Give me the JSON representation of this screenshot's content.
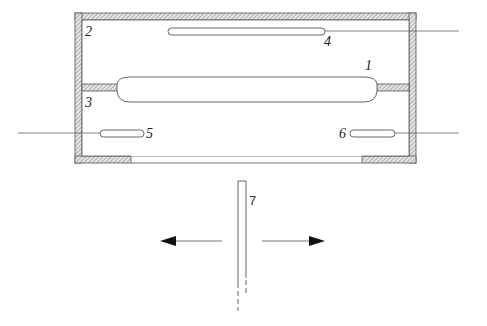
{
  "diagram": {
    "title": "",
    "colors": {
      "stroke": "#555555",
      "hatch": "#888888",
      "wire": "#666666",
      "arrow": "#111111",
      "label": "#222222"
    },
    "labels": {
      "tube_main": "1",
      "upper_chamber": "2",
      "lower_chamber": "3",
      "upper_tube": "4",
      "left_tube": "5",
      "right_tube": "6",
      "sliding_strip": "7"
    },
    "components": [
      {
        "id": "1",
        "name": "main-tube",
        "type": "elongated rounded tube spanning the partition"
      },
      {
        "id": "2",
        "name": "upper-chamber",
        "type": "enclosure compartment"
      },
      {
        "id": "3",
        "name": "lower-chamber",
        "type": "enclosure compartment with bottom window"
      },
      {
        "id": "4",
        "name": "upper-tube",
        "type": "thin tube with lead wire exiting right"
      },
      {
        "id": "5",
        "name": "left-tube",
        "type": "small tube with lead wire exiting left"
      },
      {
        "id": "6",
        "name": "right-tube",
        "type": "small tube with lead wire exiting right"
      },
      {
        "id": "7",
        "name": "sliding-strip",
        "type": "vertical strip movable left/right"
      }
    ],
    "arrows": [
      {
        "name": "move-left-arrow",
        "direction": "left"
      },
      {
        "name": "move-right-arrow",
        "direction": "right"
      }
    ]
  }
}
